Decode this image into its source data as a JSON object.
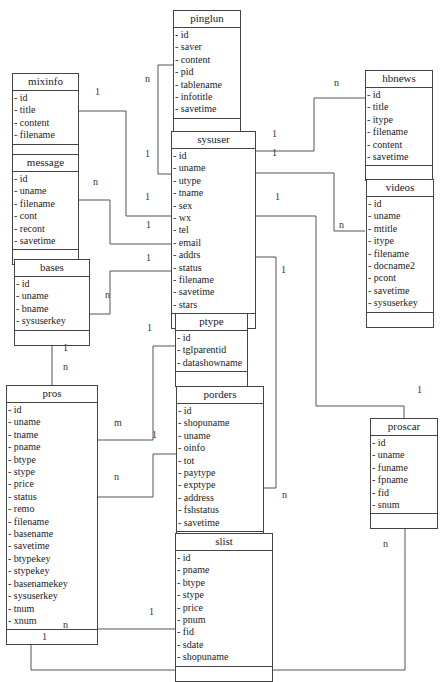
{
  "diagram": {
    "type": "er-diagram",
    "entities": [
      {
        "key": "pinglun",
        "name": "pinglun",
        "attributes": [
          "id",
          "saver",
          "content",
          "pid",
          "tablename",
          "infotitle",
          "savetime"
        ]
      },
      {
        "key": "mixinfo",
        "name": "mixinfo",
        "attributes": [
          "id",
          "title",
          "content",
          "filename"
        ]
      },
      {
        "key": "message",
        "name": "message",
        "attributes": [
          "id",
          "uname",
          "filename",
          "cont",
          "recont",
          "savetime"
        ]
      },
      {
        "key": "hbnews",
        "name": "hbnews",
        "attributes": [
          "id",
          "title",
          "itype",
          "filename",
          "content",
          "savetime"
        ]
      },
      {
        "key": "sysuser",
        "name": "sysuser",
        "attributes": [
          "id",
          "uname",
          "utype",
          "tname",
          "sex",
          "wx",
          "tel",
          "email",
          "addrs",
          "status",
          "filename",
          "savetime",
          "stars"
        ]
      },
      {
        "key": "videos",
        "name": "videos",
        "attributes": [
          "id",
          "uname",
          "mtitle",
          "itype",
          "filename",
          "docname2",
          "pcont",
          "savetime",
          "sysuserkey"
        ]
      },
      {
        "key": "bases",
        "name": "bases",
        "attributes": [
          "id",
          "uname",
          "bname",
          "sysuserkey"
        ]
      },
      {
        "key": "ptype",
        "name": "ptype",
        "attributes": [
          "id",
          "tglparentid",
          "datashowname"
        ]
      },
      {
        "key": "pros",
        "name": "pros",
        "attributes": [
          "id",
          "uname",
          "tname",
          "pname",
          "btype",
          "stype",
          "price",
          "status",
          "remo",
          "filename",
          "basename",
          "savetime",
          "btypekey",
          "stypekey",
          "basenamekey",
          "sysuserkey",
          "tnum",
          "xnum"
        ]
      },
      {
        "key": "porders",
        "name": "porders",
        "attributes": [
          "id",
          "shopuname",
          "uname",
          "oinfo",
          "tot",
          "paytype",
          "exptype",
          "address",
          "fshstatus",
          "savetime"
        ]
      },
      {
        "key": "proscar",
        "name": "proscar",
        "attributes": [
          "id",
          "uname",
          "funame",
          "fpname",
          "fid",
          "snum"
        ]
      },
      {
        "key": "slist",
        "name": "slist",
        "attributes": [
          "id",
          "pname",
          "btype",
          "stype",
          "price",
          "pnum",
          "fid",
          "sdate",
          "shopuname"
        ]
      }
    ],
    "relationships": [
      {
        "from": "sysuser",
        "to": "pinglun",
        "from_card": "1",
        "to_card": "n"
      },
      {
        "from": "sysuser",
        "to": "mixinfo",
        "from_card": "1",
        "to_card": "1"
      },
      {
        "from": "sysuser",
        "to": "message",
        "from_card": "1",
        "to_card": "n"
      },
      {
        "from": "sysuser",
        "to": "bases",
        "from_card": "1",
        "to_card": "n"
      },
      {
        "from": "sysuser",
        "to": "hbnews",
        "from_card": "1",
        "to_card": "n"
      },
      {
        "from": "sysuser",
        "to": "videos",
        "from_card": "1",
        "to_card": "n"
      },
      {
        "from": "sysuser",
        "to": "porders",
        "from_card": "1",
        "to_card": "n"
      },
      {
        "from": "sysuser",
        "to": "proscar",
        "from_card": "1",
        "to_card": "1"
      },
      {
        "from": "bases",
        "to": "pros",
        "from_card": "1",
        "to_card": "n"
      },
      {
        "from": "ptype",
        "to": "pros",
        "from_card": "1",
        "to_card": "m"
      },
      {
        "from": "porders",
        "to": "pros",
        "from_card": "1",
        "to_card": "n"
      },
      {
        "from": "slist",
        "to": "pros",
        "from_card": "1",
        "to_card": "n"
      },
      {
        "from": "pros",
        "to": "proscar",
        "from_card": "1",
        "to_card": "n"
      }
    ],
    "labels": [
      {
        "text": "n",
        "x": 148,
        "y": 79
      },
      {
        "text": "1",
        "x": 98,
        "y": 92
      },
      {
        "text": "1",
        "x": 148,
        "y": 154
      },
      {
        "text": "n",
        "x": 96,
        "y": 182
      },
      {
        "text": "1",
        "x": 148,
        "y": 197
      },
      {
        "text": "1",
        "x": 149,
        "y": 225
      },
      {
        "text": "1",
        "x": 149,
        "y": 258
      },
      {
        "text": "n",
        "x": 108,
        "y": 295
      },
      {
        "text": "1",
        "x": 275,
        "y": 134
      },
      {
        "text": "1",
        "x": 275,
        "y": 153
      },
      {
        "text": "n",
        "x": 337,
        "y": 83
      },
      {
        "text": "1",
        "x": 278,
        "y": 197
      },
      {
        "text": "n",
        "x": 342,
        "y": 225
      },
      {
        "text": "1",
        "x": 284,
        "y": 270
      },
      {
        "text": "1",
        "x": 150,
        "y": 328
      },
      {
        "text": "1",
        "x": 66,
        "y": 348
      },
      {
        "text": "n",
        "x": 66,
        "y": 367
      },
      {
        "text": "m",
        "x": 117,
        "y": 423
      },
      {
        "text": "1",
        "x": 155,
        "y": 435
      },
      {
        "text": "n",
        "x": 117,
        "y": 477
      },
      {
        "text": "n",
        "x": 285,
        "y": 495
      },
      {
        "text": "1",
        "x": 420,
        "y": 390
      },
      {
        "text": "n",
        "x": 386,
        "y": 544
      },
      {
        "text": "1",
        "x": 152,
        "y": 612
      },
      {
        "text": "n",
        "x": 66,
        "y": 625
      },
      {
        "text": "1",
        "x": 45,
        "y": 637
      }
    ]
  }
}
